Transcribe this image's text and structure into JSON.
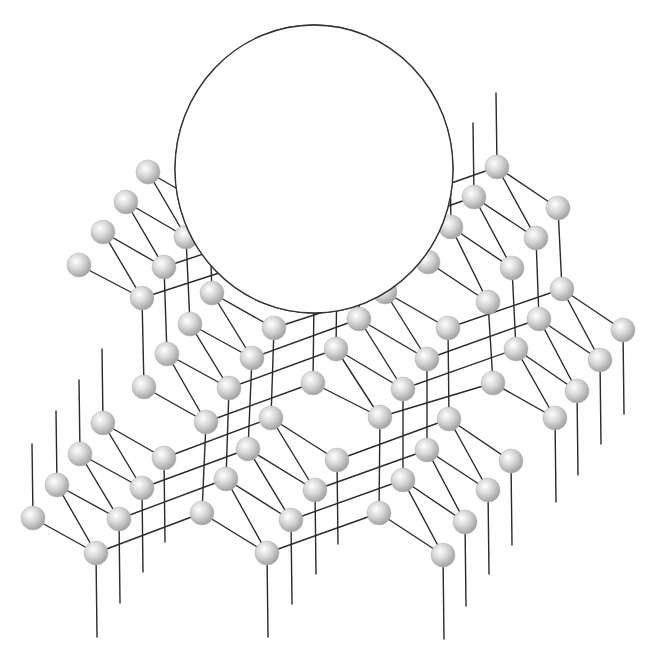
{
  "diagram": {
    "width": 656,
    "height": 659,
    "colors": {
      "background": "#ffffff",
      "bond": "#2a2a2a",
      "atom_highlight": "#ffffff",
      "atom_mid": "#d4d4d4",
      "atom_shadow": "#9a9a9a",
      "dopant": "#0a0a0a",
      "inset_outline": "#333333"
    },
    "lattice": {
      "atom_radius": 12,
      "dangling_length": 84,
      "cells": [
        {
          "id": "0,0",
          "i": 0,
          "j": 0,
          "upper": [
            [
              148,
              172
            ],
            [
              126,
              202
            ],
            [
              103,
              232
            ],
            [
              79,
              265
            ]
          ],
          "lower": [
            [
              209,
              207
            ],
            [
              186,
              237
            ],
            [
              164,
              267
            ],
            [
              142,
              298
            ]
          ],
          "dangle_up": false,
          "dangle_down": false
        },
        {
          "id": "1,0",
          "i": 1,
          "j": 0,
          "upper": [
            [
              322,
              170
            ],
            [
              299,
              200
            ],
            [
              276,
              230
            ],
            [
              253,
              262
            ]
          ],
          "lower": [
            [
              383,
              207
            ],
            [
              360,
              237
            ],
            [
              337,
              267
            ],
            [
              314,
              298
            ]
          ],
          "dangle_up": false,
          "dangle_down": false
        },
        {
          "id": "2,0",
          "i": 2,
          "j": 0,
          "upper": [
            [
              497,
              167
            ],
            [
              474,
              197
            ],
            [
              451,
              227
            ],
            [
              428,
              262
            ]
          ],
          "lower": [
            [
              558,
              208
            ],
            [
              536,
              238
            ],
            [
              512,
              268
            ],
            [
              488,
              302
            ]
          ],
          "dangle_up": true,
          "dangle_down": false
        },
        {
          "id": "0,1",
          "i": 0,
          "j": 1,
          "upper": [
            [
              212,
              293
            ],
            [
              190,
              324
            ],
            [
              167,
              354
            ],
            [
              144,
              387
            ]
          ],
          "lower": [
            [
              274,
              328
            ],
            [
              252,
              358
            ],
            [
              229,
              388
            ],
            [
              206,
              422
            ]
          ],
          "dangle_up": false,
          "dangle_down": false
        },
        {
          "id": "1,1",
          "i": 1,
          "j": 1,
          "upper": [
            [
              385,
              292
            ],
            [
              359,
              319
            ],
            [
              336,
              349
            ],
            [
              313,
              383
            ]
          ],
          "lower": [
            [
              448,
              328
            ],
            [
              427,
              359
            ],
            [
              403,
              389
            ],
            [
              380,
              417
            ]
          ],
          "dangle_up": false,
          "dangle_down": false
        },
        {
          "id": "2,1",
          "i": 2,
          "j": 1,
          "upper": [
            [
              562,
              289
            ],
            [
              539,
              319
            ],
            [
              516,
              349
            ],
            [
              493,
              383
            ]
          ],
          "lower": [
            [
              623,
              330
            ],
            [
              600,
              360
            ],
            [
              577,
              391
            ],
            [
              555,
              418
            ]
          ],
          "dangle_up": false,
          "dangle_down": true
        },
        {
          "id": "-1,2",
          "i": -1,
          "j": 2,
          "upper": [
            [
              103,
              423
            ],
            [
              80,
              454
            ],
            [
              57,
              485
            ],
            [
              33,
              518
            ]
          ],
          "lower": [
            [
              164,
              458
            ],
            [
              142,
              488
            ],
            [
              119,
              519
            ],
            [
              96,
              553
            ]
          ],
          "dangle_up": true,
          "dangle_down": true
        },
        {
          "id": "0,2",
          "i": 0,
          "j": 2,
          "upper": [
            [
              271,
              418
            ],
            [
              248,
              449
            ],
            [
              226,
              479
            ],
            [
              202,
              513
            ]
          ],
          "lower": [
            [
              337,
              460
            ],
            [
              315,
              490
            ],
            [
              291,
              520
            ],
            [
              267,
              553
            ]
          ],
          "dangle_up": false,
          "dangle_down": true
        },
        {
          "id": "1,2",
          "i": 1,
          "j": 2,
          "upper": [
            [
              449,
              419
            ],
            [
              427,
              450
            ],
            [
              403,
              480
            ],
            [
              379,
              513
            ]
          ],
          "lower": [
            [
              511,
              461
            ],
            [
              488,
              490
            ],
            [
              465,
              522
            ],
            [
              443,
              555
            ]
          ],
          "dangle_up": false,
          "dangle_down": true
        }
      ]
    },
    "inset": {
      "label": "magnified view",
      "circle": {
        "cx": 314,
        "cy": 169,
        "rx": 139,
        "ry": 144
      },
      "host_atoms": [
        {
          "name": "host-atom-a",
          "x": 322,
          "y": 162,
          "r": 24
        },
        {
          "name": "host-atom-b",
          "x": 277,
          "y": 223,
          "r": 24
        },
        {
          "name": "host-atom-c",
          "x": 234,
          "y": 278,
          "r": 23
        }
      ],
      "dopant_atoms": [
        {
          "name": "dopant-atom-top",
          "x": 323,
          "y": 87,
          "r": 12
        },
        {
          "name": "dopant-atom-right",
          "x": 386,
          "y": 196,
          "r": 12
        },
        {
          "name": "dopant-atom-lower-right",
          "x": 382,
          "y": 268,
          "r": 12
        },
        {
          "name": "dopant-atom-left",
          "x": 208,
          "y": 205,
          "r": 12
        }
      ],
      "thick_bonds": [
        [
          322,
          26,
          322,
          140
        ],
        [
          345,
          172,
          440,
          228
        ],
        [
          333,
          184,
          389,
          284
        ],
        [
          300,
          170,
          180,
          214
        ],
        [
          255,
          230,
          176,
          257
        ],
        [
          290,
          245,
          326,
          313
        ],
        [
          298,
          236,
          378,
          294
        ]
      ],
      "thin_lines": [
        [
          280,
          55,
          280,
          200
        ],
        [
          234,
          121,
          234,
          257
        ],
        [
          181,
          183,
          181,
          212
        ],
        [
          453,
          143,
          453,
          175
        ]
      ]
    }
  }
}
